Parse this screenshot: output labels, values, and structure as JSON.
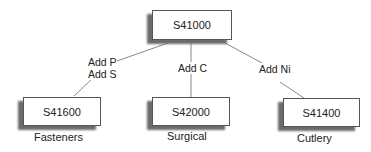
{
  "diagram": {
    "root": {
      "id": "S41000"
    },
    "children": [
      {
        "id": "S41600",
        "label": "Fasteners",
        "edge_label": [
          "Add P",
          "Add S"
        ]
      },
      {
        "id": "S42000",
        "label": "Surgical",
        "edge_label": [
          "Add C"
        ]
      },
      {
        "id": "S41400",
        "label": "Cutlery",
        "edge_label": [
          "Add Ni"
        ]
      }
    ]
  },
  "colors": {
    "line": "#888888",
    "border": "#555555",
    "shadow": "#6b6b6b"
  }
}
